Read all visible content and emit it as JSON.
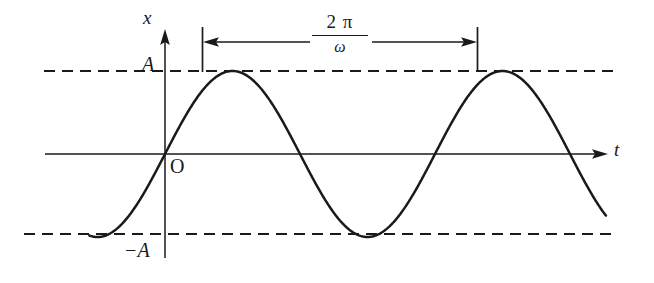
{
  "figure": {
    "background_color": "#ffffff",
    "stroke_color": "#1a1a1a",
    "axes": {
      "vertical_axis_label": "x",
      "horizontal_axis_label": "t",
      "origin_label": "O"
    },
    "amplitude_labels": {
      "positive": "A",
      "negative": "−A"
    },
    "period_annotation": {
      "numerator": "2 π",
      "denominator": "ω",
      "full_text": "2π/ω"
    }
  },
  "chart_data": {
    "type": "line",
    "title": "",
    "xlabel": "t",
    "ylabel": "x",
    "grid": false,
    "legend": "none",
    "xlim": [
      -0.28,
      2.08
    ],
    "ylim": [
      -1.35,
      1.35
    ],
    "yticks": [
      1,
      0,
      -1
    ],
    "ytick_labels": [
      "A",
      "O",
      "−A"
    ],
    "annotations": [
      {
        "text": "2π/ω",
        "type": "double-headed-arrow",
        "from_x": 0.25,
        "to_x": 1.25,
        "y": 1.22,
        "meaning": "period"
      },
      {
        "text": "A",
        "type": "dashed-horizontal-line",
        "y": 1
      },
      {
        "text": "−A",
        "type": "dashed-horizontal-line",
        "y": -1
      }
    ],
    "series": [
      {
        "name": "x(t) = A sin(ωt)",
        "function": "A*sin(2*pi*x)",
        "amplitude": 1,
        "period": 1,
        "x": [
          -0.28,
          -0.25,
          -0.2,
          -0.15,
          -0.1,
          -0.05,
          0,
          0.05,
          0.1,
          0.15,
          0.2,
          0.25,
          0.3,
          0.35,
          0.4,
          0.45,
          0.5,
          0.55,
          0.6,
          0.65,
          0.7,
          0.75,
          0.8,
          0.85,
          0.9,
          0.95,
          1,
          1.05,
          1.1,
          1.15,
          1.2,
          1.25,
          1.3,
          1.35,
          1.4,
          1.45,
          1.5,
          1.55,
          1.6,
          1.65,
          1.7,
          1.75
        ],
        "y": [
          -0.982,
          -1,
          -0.951,
          -0.809,
          -0.588,
          -0.309,
          0,
          0.309,
          0.588,
          0.809,
          0.951,
          1,
          0.951,
          0.809,
          0.588,
          0.309,
          0,
          -0.309,
          -0.588,
          -0.809,
          -0.951,
          -1,
          -0.951,
          -0.809,
          -0.588,
          -0.309,
          0,
          0.309,
          0.588,
          0.809,
          0.951,
          1,
          0.951,
          0.809,
          0.588,
          0.309,
          0,
          -0.309,
          -0.588,
          -0.809,
          -0.951,
          -1
        ]
      }
    ]
  }
}
